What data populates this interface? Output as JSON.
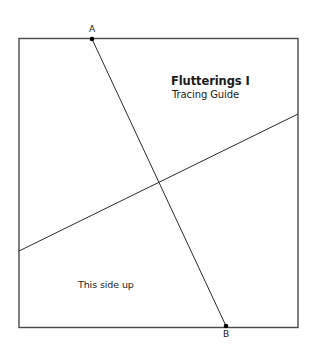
{
  "diagram": {
    "title": "Flutterings I",
    "subtitle": "Tracing Guide",
    "note": "This side up",
    "colors": {
      "background": "#ffffff",
      "border": "#4a4a4a",
      "line": "#2a2a2a",
      "point": "#000000",
      "text": "#1a1a1a"
    },
    "square": {
      "x1": 19,
      "y1": 38,
      "x2": 298,
      "y2": 327
    },
    "points": [
      {
        "id": "A",
        "label": "A",
        "x": 92,
        "y": 39
      },
      {
        "id": "B",
        "label": "B",
        "x": 226,
        "y": 326
      }
    ],
    "lines": [
      {
        "name": "line-a-to-b",
        "from": [
          92,
          39
        ],
        "to": [
          226,
          326
        ]
      },
      {
        "name": "diagonal-line",
        "from": [
          19,
          251
        ],
        "to": [
          298,
          114
        ]
      }
    ],
    "intersection": {
      "x": 158,
      "y": 182
    }
  }
}
